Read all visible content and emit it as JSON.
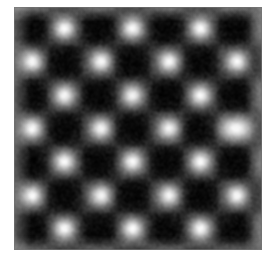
{
  "view": {
    "canvas_width": 276,
    "canvas_height": 259,
    "page_background": "#ffffff"
  },
  "micrograph": {
    "title": "",
    "frame": {
      "left": 14,
      "top": 7,
      "width": 248,
      "height": 243
    },
    "modality": "scanning-probe-atomic-resolution",
    "colormap": "grayscale",
    "colors": {
      "minimum": "#050505",
      "low": "#141414",
      "mid": "#6b6b6b",
      "high": "#c8c8c8",
      "maximum": "#ffffff",
      "border": "#787878"
    },
    "noise": {
      "grain_amplitude": 26,
      "row_streak_amplitude": 7
    },
    "vignette": true
  },
  "chart_data": {
    "type": "heatmap",
    "title": "",
    "subtitle": "",
    "xlabel": "",
    "ylabel": "",
    "xticklabels": [],
    "yticklabels": [],
    "grid": false,
    "legend": null,
    "colorbar": false,
    "colormap": "gray",
    "zrange": [
      0,
      1
    ],
    "lattice": {
      "symmetry": "square-centered-checkerboard",
      "x_period_px": 68,
      "y_period_px": 67,
      "x_origin_px": 64,
      "y_origin_px": 28,
      "rows": 7,
      "row_kind_sequence": [
        "A",
        "B",
        "A",
        "B",
        "A",
        "B",
        "A"
      ],
      "row_A_columns_px": [
        -4,
        64,
        132,
        200,
        252
      ],
      "row_B_columns_px": [
        32,
        101,
        169,
        237
      ],
      "row_y_centers_px": [
        28,
        61,
        95,
        128,
        161,
        195,
        228
      ]
    },
    "bright_maxima": [
      {
        "x": 64,
        "y": 28,
        "amp": 1.0,
        "rx": 11,
        "ry": 11
      },
      {
        "x": 132,
        "y": 28,
        "amp": 1.0,
        "rx": 11,
        "ry": 11
      },
      {
        "x": 200,
        "y": 28,
        "amp": 1.0,
        "rx": 11,
        "ry": 11
      },
      {
        "x": 32,
        "y": 61,
        "amp": 1.0,
        "rx": 11,
        "ry": 11
      },
      {
        "x": 101,
        "y": 61,
        "amp": 1.0,
        "rx": 11,
        "ry": 11
      },
      {
        "x": 169,
        "y": 61,
        "amp": 1.0,
        "rx": 11,
        "ry": 11
      },
      {
        "x": 237,
        "y": 61,
        "amp": 1.0,
        "rx": 11,
        "ry": 11
      },
      {
        "x": 64,
        "y": 95,
        "amp": 0.98,
        "rx": 11,
        "ry": 11
      },
      {
        "x": 132,
        "y": 95,
        "amp": 0.96,
        "rx": 11,
        "ry": 11
      },
      {
        "x": 200,
        "y": 95,
        "amp": 0.98,
        "rx": 11,
        "ry": 11
      },
      {
        "x": 32,
        "y": 128,
        "amp": 1.0,
        "rx": 11,
        "ry": 11
      },
      {
        "x": 101,
        "y": 128,
        "amp": 0.98,
        "rx": 11,
        "ry": 11
      },
      {
        "x": 169,
        "y": 128,
        "amp": 0.98,
        "rx": 11,
        "ry": 11
      },
      {
        "x": 237,
        "y": 128,
        "amp": 1.0,
        "rx": 23,
        "ry": 13,
        "defect": true
      },
      {
        "x": 64,
        "y": 161,
        "amp": 1.0,
        "rx": 11,
        "ry": 11
      },
      {
        "x": 132,
        "y": 161,
        "amp": 1.0,
        "rx": 11,
        "ry": 11
      },
      {
        "x": 200,
        "y": 161,
        "amp": 1.0,
        "rx": 11,
        "ry": 11
      },
      {
        "x": 32,
        "y": 195,
        "amp": 1.0,
        "rx": 11,
        "ry": 11
      },
      {
        "x": 101,
        "y": 195,
        "amp": 0.98,
        "rx": 11,
        "ry": 11
      },
      {
        "x": 169,
        "y": 195,
        "amp": 0.98,
        "rx": 11,
        "ry": 11
      },
      {
        "x": 237,
        "y": 195,
        "amp": 1.0,
        "rx": 11,
        "ry": 11
      },
      {
        "x": 64,
        "y": 228,
        "amp": 1.0,
        "rx": 11,
        "ry": 11
      },
      {
        "x": 132,
        "y": 228,
        "amp": 1.0,
        "rx": 11,
        "ry": 11
      },
      {
        "x": 200,
        "y": 228,
        "amp": 1.0,
        "rx": 11,
        "ry": 11
      }
    ],
    "dark_minima": [
      {
        "x": 32,
        "y": 28,
        "depth": 1.0
      },
      {
        "x": 101,
        "y": 28,
        "depth": 1.0
      },
      {
        "x": 169,
        "y": 28,
        "depth": 1.0
      },
      {
        "x": 237,
        "y": 28,
        "depth": 1.0
      },
      {
        "x": 64,
        "y": 61,
        "depth": 1.0
      },
      {
        "x": 132,
        "y": 61,
        "depth": 1.0
      },
      {
        "x": 200,
        "y": 61,
        "depth": 1.0
      },
      {
        "x": 32,
        "y": 95,
        "depth": 1.0
      },
      {
        "x": 101,
        "y": 95,
        "depth": 1.0
      },
      {
        "x": 169,
        "y": 95,
        "depth": 1.0
      },
      {
        "x": 237,
        "y": 95,
        "depth": 1.0
      },
      {
        "x": 64,
        "y": 128,
        "depth": 1.0
      },
      {
        "x": 132,
        "y": 128,
        "depth": 1.0
      },
      {
        "x": 200,
        "y": 128,
        "depth": 0.9
      },
      {
        "x": 32,
        "y": 161,
        "depth": 1.0
      },
      {
        "x": 101,
        "y": 161,
        "depth": 1.0
      },
      {
        "x": 169,
        "y": 161,
        "depth": 1.0
      },
      {
        "x": 237,
        "y": 161,
        "depth": 1.0
      },
      {
        "x": 64,
        "y": 195,
        "depth": 1.0
      },
      {
        "x": 132,
        "y": 195,
        "depth": 1.0
      },
      {
        "x": 200,
        "y": 195,
        "depth": 1.0
      },
      {
        "x": 32,
        "y": 228,
        "depth": 1.0
      },
      {
        "x": 101,
        "y": 228,
        "depth": 1.0
      },
      {
        "x": 169,
        "y": 228,
        "depth": 1.0
      },
      {
        "x": 237,
        "y": 228,
        "depth": 1.0
      }
    ]
  }
}
